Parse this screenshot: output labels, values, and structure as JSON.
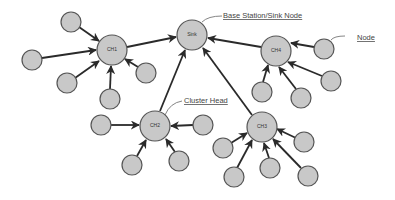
{
  "diagram": {
    "type": "wireless-sensor-network-clustering",
    "nodes": {
      "sink": {
        "label": "Sink",
        "x": 192,
        "y": 35,
        "r": 15
      },
      "ch1": {
        "label": "CH1",
        "x": 112,
        "y": 50,
        "r": 15
      },
      "ch2": {
        "label": "CH2",
        "x": 155,
        "y": 126,
        "r": 15
      },
      "ch3": {
        "label": "CH3",
        "x": 262,
        "y": 127,
        "r": 15
      },
      "ch4": {
        "label": "CH4",
        "x": 276,
        "y": 51,
        "r": 15
      }
    },
    "annotations": {
      "sink": "Base Station/Sink Node",
      "cluster_head": "Cluster Head",
      "node": "Node"
    },
    "colors": {
      "node_fill": "#c8c8c8",
      "node_stroke": "#555555",
      "edge": "#2a2a2a"
    }
  }
}
